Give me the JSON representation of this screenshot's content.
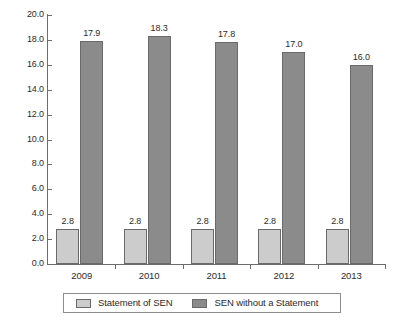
{
  "chart_data": {
    "type": "bar",
    "title": "",
    "subtitle": "",
    "xlabel": "",
    "ylabel": "",
    "categories": [
      "2009",
      "2010",
      "2011",
      "2012",
      "2013"
    ],
    "series": [
      {
        "name": "Statement of SEN",
        "color": "#cccccc",
        "values": [
          2.8,
          2.8,
          2.8,
          2.8,
          2.8
        ],
        "value_labels": [
          "2.8",
          "2.8",
          "2.8",
          "2.8",
          "2.8"
        ]
      },
      {
        "name": "SEN without a Statement",
        "color": "#8b8b8b",
        "values": [
          17.9,
          18.3,
          17.8,
          17.0,
          16.0
        ],
        "value_labels": [
          "17.9",
          "18.3",
          "17.8",
          "17.0",
          "16.0"
        ]
      }
    ],
    "ylim": [
      0.0,
      20.0
    ],
    "ytick_step": 2.0,
    "ytick_labels": [
      "20.0",
      "18.0",
      "16.0",
      "14.0",
      "12.0",
      "10.0",
      "8.0",
      "6.0",
      "4.0",
      "2.0",
      "0.0"
    ],
    "ytick_values": [
      20.0,
      18.0,
      16.0,
      14.0,
      12.0,
      10.0,
      8.0,
      6.0,
      4.0,
      2.0,
      0.0
    ],
    "grid": false,
    "legend_position": "bottom",
    "data_labels_shown": true,
    "axis_color": "#6d6d6d",
    "bar_border_color": "#6a6a6a",
    "background": "#ffffff"
  },
  "legend": {
    "items": [
      {
        "label": "Statement of SEN",
        "color": "#cccccc"
      },
      {
        "label": "SEN without a Statement",
        "color": "#8b8b8b"
      }
    ]
  }
}
